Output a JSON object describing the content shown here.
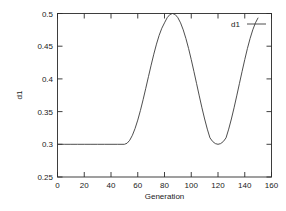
{
  "chart_data": {
    "type": "line",
    "title": "",
    "xlabel": "Generation",
    "ylabel": "d1",
    "xlim": [
      0,
      160
    ],
    "ylim": [
      0.25,
      0.5
    ],
    "xticks": [
      0,
      20,
      40,
      60,
      80,
      100,
      120,
      140,
      160
    ],
    "xtick_labels": [
      "0",
      "20",
      "40",
      "60",
      "80",
      "100",
      "120",
      "140",
      "160"
    ],
    "yticks": [
      0.25,
      0.3,
      0.35,
      0.4,
      0.45,
      0.5
    ],
    "ytick_labels": [
      "0.25",
      "0.3",
      "0.35",
      "0.4",
      "0.45",
      "0.5"
    ],
    "grid": false,
    "legend_position": "top-right",
    "series": [
      {
        "name": "d1",
        "color": "#3a3a3a",
        "x": [
          0,
          5,
          10,
          15,
          20,
          25,
          30,
          35,
          40,
          45,
          50,
          52,
          54,
          56,
          58,
          60,
          62,
          64,
          66,
          68,
          70,
          72,
          74,
          76,
          78,
          80,
          82,
          84,
          86,
          88,
          90,
          92,
          94,
          96,
          98,
          100,
          102,
          104,
          106,
          108,
          110,
          112,
          114,
          116,
          118,
          120,
          122,
          124,
          126,
          128,
          130,
          132,
          134,
          136,
          138,
          140,
          142,
          144,
          146,
          148,
          150
        ],
        "values": [
          0.3,
          0.3,
          0.3,
          0.3,
          0.3,
          0.3,
          0.3,
          0.3,
          0.3,
          0.3,
          0.3,
          0.3016,
          0.3062,
          0.3138,
          0.3242,
          0.337,
          0.3518,
          0.3682,
          0.3856,
          0.4034,
          0.421,
          0.4378,
          0.4532,
          0.4666,
          0.4775,
          0.4857,
          0.4936,
          0.4984,
          0.5,
          0.4984,
          0.4936,
          0.4857,
          0.475,
          0.4618,
          0.4465,
          0.4295,
          0.4114,
          0.3927,
          0.374,
          0.3558,
          0.3387,
          0.3232,
          0.3098,
          0.3043,
          0.3011,
          0.3,
          0.3011,
          0.3043,
          0.3098,
          0.3232,
          0.3387,
          0.3558,
          0.374,
          0.3927,
          0.4114,
          0.4295,
          0.4465,
          0.4618,
          0.475,
          0.4857,
          0.4936
        ]
      }
    ]
  },
  "legend": {
    "entries": [
      {
        "label": "d1"
      }
    ]
  },
  "axes": {
    "x_title": "Generation",
    "y_title": "d1"
  }
}
